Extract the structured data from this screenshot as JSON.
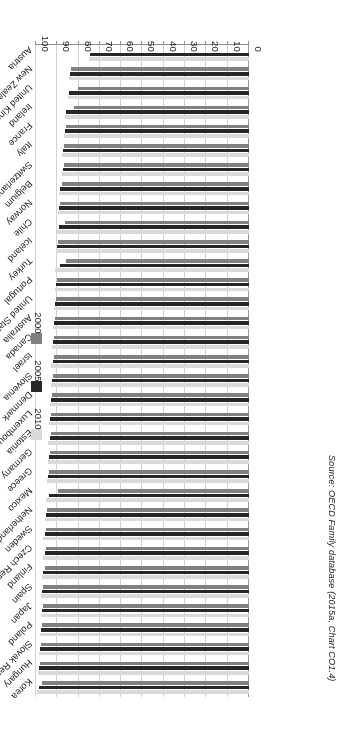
{
  "chart_data": {
    "type": "bar",
    "orientation": "horizontal",
    "title": "",
    "xlabel": "",
    "ylabel": "",
    "xlim": [
      0,
      100
    ],
    "xticks": [
      "0",
      "10",
      "20",
      "30",
      "40",
      "50",
      "60",
      "70",
      "80",
      "90",
      "100"
    ],
    "grid": true,
    "legend_position": "left",
    "legend": [
      "2000",
      "2005",
      "2010"
    ],
    "series_colors": {
      "2000": "#808080",
      "2005": "#262626",
      "2010": "#d9d9d9"
    },
    "categories": [
      "Korea",
      "Hungary",
      "Slovak Republic",
      "Poland",
      "Japan",
      "Spain",
      "Finland",
      "Czech Republic",
      "Sweden",
      "Netherlands",
      "Mexico",
      "Greece",
      "Germany",
      "Estonia",
      "Luxembourg",
      "Denmark",
      "Slovenia",
      "Israel",
      "Canada",
      "Australia",
      "United States",
      "Portugal",
      "Turkey",
      "Iceland",
      "Chile",
      "Norway",
      "Belgium",
      "Switzerland",
      "Italy",
      "France",
      "Ireland",
      "United Kingdom",
      "New Zealand",
      "Austria"
    ],
    "series": [
      {
        "name": "2010",
        "values": [
          99.5,
          99.0,
          98.5,
          98.0,
          97.5,
          97.5,
          97.0,
          96.5,
          96.5,
          96.0,
          95.5,
          95.0,
          94.5,
          94.5,
          94.0,
          93.5,
          93.0,
          93.0,
          92.5,
          92.0,
          91.5,
          91.0,
          91.0,
          90.5,
          90.0,
          89.5,
          89.0,
          88.0,
          88.0,
          87.0,
          86.5,
          85.0,
          84.5,
          75.0
        ]
      },
      {
        "name": "2005",
        "values": [
          98.5,
          98.5,
          98.0,
          97.5,
          97.0,
          97.0,
          96.5,
          96.0,
          96.0,
          95.5,
          94.0,
          94.5,
          94.0,
          93.5,
          93.5,
          93.0,
          92.5,
          92.0,
          92.0,
          91.5,
          91.0,
          90.5,
          88.5,
          90.0,
          89.0,
          89.0,
          88.5,
          87.5,
          87.5,
          86.5,
          86.0,
          84.5,
          84.0,
          74.5
        ]
      },
      {
        "name": "2000",
        "values": [
          97.0,
          98.0,
          97.5,
          97.0,
          96.5,
          96.5,
          96.0,
          95.5,
          95.5,
          95.0,
          89.5,
          94.0,
          93.5,
          93.0,
          93.0,
          92.5,
          92.0,
          91.5,
          91.5,
          91.0,
          90.5,
          90.0,
          86.0,
          89.5,
          86.5,
          88.5,
          88.0,
          87.0,
          87.0,
          86.0,
          82.0,
          80.5,
          83.5,
          null
        ]
      }
    ]
  },
  "source_note": "Source: OECD Family database (2015a, Chart CO1.4)"
}
